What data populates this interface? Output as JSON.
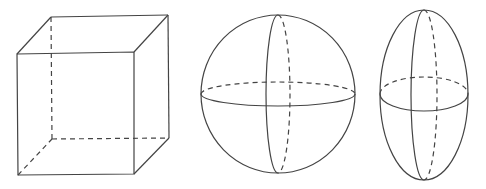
{
  "diagram": {
    "stroke_color": "#444444",
    "background": "#ffffff",
    "shapes": [
      {
        "name": "cube",
        "hidden_edges": "dashed",
        "visible_edges": "solid"
      },
      {
        "name": "sphere",
        "meridian": "vertical great circle",
        "equator": "horizontal great circle",
        "hidden_halves": "dashed"
      },
      {
        "name": "ellipsoid",
        "orientation": "vertical",
        "meridian": "vertical section",
        "equator": "horizontal section",
        "hidden_halves": "dashed"
      }
    ]
  }
}
